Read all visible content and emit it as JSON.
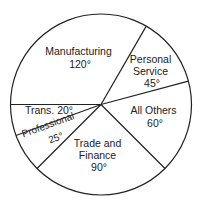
{
  "chart_data": {
    "type": "pie",
    "title": "",
    "unit": "degrees",
    "categories": [
      "Manufacturing",
      "Personal Service",
      "All Others",
      "Trade and Finance",
      "Professional",
      "Trans."
    ],
    "values": [
      120,
      45,
      60,
      90,
      25,
      20
    ],
    "labels": [
      {
        "lines": [
          "Manufacturing",
          "120°"
        ]
      },
      {
        "lines": [
          "Personal",
          "Service",
          "45°"
        ]
      },
      {
        "lines": [
          "All Others",
          "60°"
        ]
      },
      {
        "lines": [
          "Trade and",
          "Finance",
          "90°"
        ]
      },
      {
        "lines": [
          "Professional",
          "25°"
        ]
      },
      {
        "lines": [
          "Trans. 20°"
        ]
      }
    ],
    "start_angle_deg": 180,
    "direction": "clockwise",
    "fill": "#ffffff",
    "stroke": "#222222"
  }
}
